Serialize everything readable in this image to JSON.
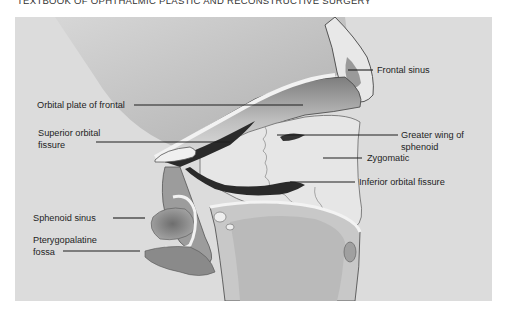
{
  "page": {
    "running_head": "TEXTBOOK OF OPHTHALMIC PLASTIC AND RECONSTRUCTIVE SURGERY"
  },
  "figure": {
    "background_color": "#dcdcdc",
    "labels": {
      "frontal_sinus": "Frontal sinus",
      "orbital_plate": "Orbital plate of frontal",
      "superior_fissure_1": "Superior orbital",
      "superior_fissure_2": "fissure",
      "greater_wing_1": "Greater wing of",
      "greater_wing_2": "sphenoid",
      "zygomatic": "Zygomatic",
      "inferior_fissure": "Inferior orbital fissure",
      "sphenoid_sinus": "Sphenoid sinus",
      "pterygopalatine_1": "Pterygopalatine",
      "pterygopalatine_2": "fossa"
    }
  }
}
